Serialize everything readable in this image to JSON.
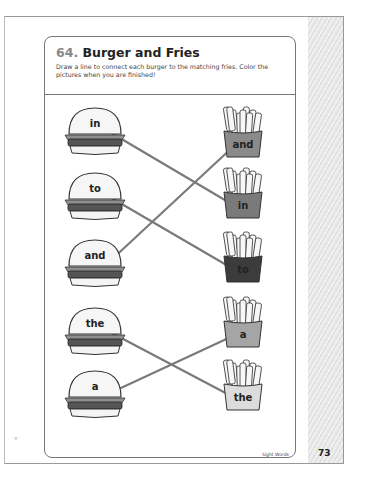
{
  "worksheet": {
    "number": "64.",
    "title": "Burger and Fries",
    "instructions": "Draw a line to connect each burger to the matching fries. Color the pictures when you are finished!"
  },
  "burgers": [
    {
      "word": "in"
    },
    {
      "word": "to"
    },
    {
      "word": "and"
    },
    {
      "word": "the"
    },
    {
      "word": "a"
    }
  ],
  "fries": [
    {
      "word": "and",
      "shade": "#8a8a8a"
    },
    {
      "word": "in",
      "shade": "#7a7a7a"
    },
    {
      "word": "to",
      "shade": "#3c3c3c"
    },
    {
      "word": "a",
      "shade": "#a5a5a5"
    },
    {
      "word": "the",
      "shade": "#dcdcdc"
    }
  ],
  "connections": [
    {
      "burger": "in",
      "fries": "in"
    },
    {
      "burger": "to",
      "fries": "to"
    },
    {
      "burger": "and",
      "fries": "and"
    },
    {
      "burger": "the",
      "fries": "the"
    },
    {
      "burger": "a",
      "fries": "a"
    }
  ],
  "line_color": "#7a7a7a",
  "footer": {
    "section_label": "Sight Words",
    "page_number": "73"
  }
}
